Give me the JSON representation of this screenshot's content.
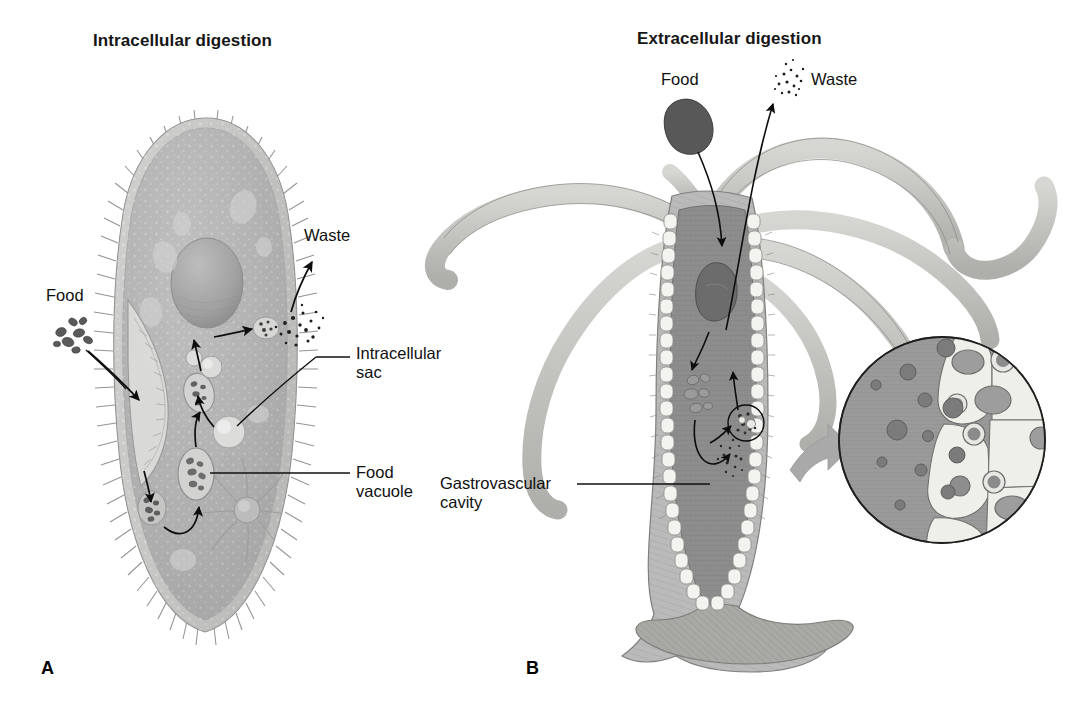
{
  "figure": {
    "kind": "biology-diagram",
    "topic": "Comparison of intracellular and extracellular digestion"
  },
  "panels": [
    {
      "letter": "A",
      "title": "Intracellular digestion",
      "organism": "paramecium",
      "labels": [
        {
          "id": "food",
          "text": "Food"
        },
        {
          "id": "waste",
          "text": "Waste"
        },
        {
          "id": "intracellular-sac",
          "text": "Intracellular",
          "text2": "sac"
        },
        {
          "id": "food-vacuole",
          "text": "Food",
          "text2": "vacuole"
        }
      ]
    },
    {
      "letter": "B",
      "title": "Extracellular digestion",
      "organism": "hydra",
      "labels": [
        {
          "id": "food",
          "text": "Food"
        },
        {
          "id": "waste",
          "text": "Waste"
        },
        {
          "id": "gastrovascular-cavity",
          "text": "Gastrovascular",
          "text2": "cavity"
        }
      ]
    }
  ],
  "colors": {
    "background": "#ffffff",
    "ink": "#101010",
    "paramecium_body": "#b2b2b2",
    "paramecium_rim": "#d8d8d6",
    "paramecium_macronucleus": "#a3a3a3",
    "food_particle_dark": "#565656",
    "hydra_tentacle": "#c6c6c2",
    "hydra_body_wall": "#b9b9b5",
    "hydra_cavity": "#8d8d8d",
    "hydra_food_bolus": "#6b6b6b",
    "hydra_lining_cells": "#f2f2ee",
    "inset_cavity": "#9a9a9a",
    "inset_cell_fill": "#efefea",
    "inset_vesicle": "#8a8a8a",
    "callout_arrow": "#a8a8a8"
  }
}
